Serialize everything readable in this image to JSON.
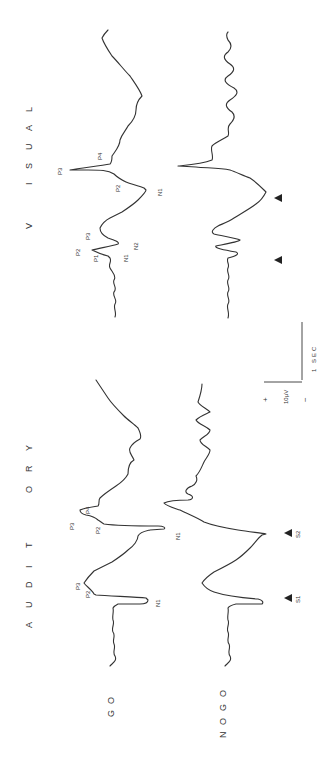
{
  "figure": {
    "orientation": "rotated-90-ccw",
    "panels": [
      {
        "title": "AUDITORY",
        "title_letters": [
          "A",
          "U",
          "D",
          "I",
          "T",
          "O",
          "R",
          "Y"
        ],
        "stimulus_markers": [
          "S1",
          "S2"
        ],
        "go_peaks": [
          "P2",
          "P3",
          "N1",
          "P2",
          "P3",
          "P4",
          "N1"
        ],
        "nogo_peaks": []
      },
      {
        "title": "VISUAL",
        "title_letters": [
          "V",
          "I",
          "S",
          "U",
          "A",
          "L"
        ],
        "stimulus_markers": [
          "",
          ""
        ],
        "go_peaks": [
          "P1",
          "P2",
          "P3",
          "N1",
          "N2",
          "P2",
          "P3",
          "P4",
          "N1"
        ],
        "nogo_peaks": []
      }
    ],
    "conditions": [
      "GO",
      "NOGO"
    ],
    "condition_letters": {
      "go": [
        "G",
        "O"
      ],
      "nogo": [
        "N",
        "O",
        "G",
        "O"
      ]
    },
    "scale_bar": {
      "plus": "+",
      "minus": "−",
      "amplitude": "10 μV",
      "amplitude_label": "10μV",
      "time": "1 SEC"
    },
    "labels": {
      "aud_go_p2a": "P2",
      "aud_go_p3a": "P3",
      "aud_go_n1a": "N1",
      "aud_go_p2b": "P2",
      "aud_go_p3b": "P3",
      "aud_go_p4b": "P4",
      "aud_go_n1b": "N1",
      "aud_s1": "S1",
      "aud_s2": "S2",
      "vis_go_p1": "P1",
      "vis_go_p2a": "P2",
      "vis_go_p3a": "P3",
      "vis_go_n1a": "N1",
      "vis_go_n2": "N2",
      "vis_go_p2b": "P2",
      "vis_go_p3b": "P3",
      "vis_go_p4": "P4",
      "vis_go_n1b": "N1"
    }
  }
}
